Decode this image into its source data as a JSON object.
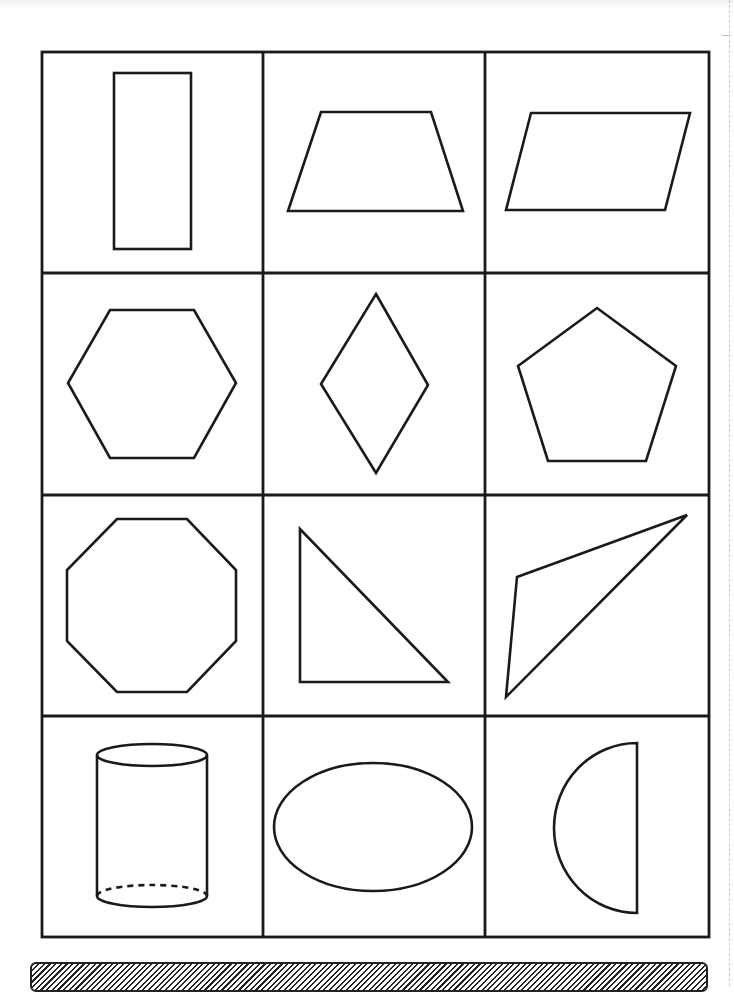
{
  "worksheet": {
    "grid": {
      "rows": 4,
      "columns": 3
    },
    "cells": [
      {
        "shape": "rectangle",
        "icon": "rectangle-icon"
      },
      {
        "shape": "trapezoid",
        "icon": "trapezoid-icon"
      },
      {
        "shape": "parallelogram",
        "icon": "parallelogram-icon"
      },
      {
        "shape": "hexagon",
        "icon": "hexagon-icon"
      },
      {
        "shape": "rhombus",
        "icon": "rhombus-icon"
      },
      {
        "shape": "pentagon",
        "icon": "pentagon-icon"
      },
      {
        "shape": "octagon",
        "icon": "octagon-icon"
      },
      {
        "shape": "right triangle",
        "icon": "right-triangle-icon"
      },
      {
        "shape": "scalene triangle",
        "icon": "scalene-triangle-icon"
      },
      {
        "shape": "cylinder",
        "icon": "cylinder-icon"
      },
      {
        "shape": "oval",
        "icon": "oval-icon"
      },
      {
        "shape": "semicircle",
        "icon": "semicircle-icon"
      }
    ],
    "colors": {
      "stroke": "#1a1a1a",
      "background": "#ffffff"
    }
  },
  "footer_bar": {
    "pattern": "diagonal-hatch"
  }
}
